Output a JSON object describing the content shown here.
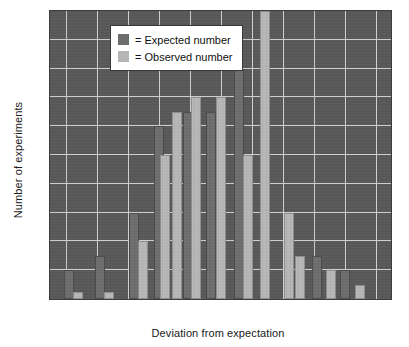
{
  "chart_data": {
    "type": "bar",
    "title": "",
    "xlabel": "Deviation from expectation",
    "ylabel": "Number of experiments",
    "xlim": [
      -2.75,
      2.75
    ],
    "ylim": [
      0,
      20
    ],
    "grid": true,
    "legend_position": "top-left",
    "xticks": [
      "0",
      "−2.5",
      "−2.0",
      "−1.5",
      "−1.0",
      "−0.5",
      "0",
      "0.5",
      "1.0",
      "1.5",
      "2.0",
      "2.5"
    ],
    "xtick_values": [
      -3.0,
      -2.5,
      -2.0,
      -1.5,
      -1.0,
      -0.5,
      0,
      0.5,
      1.0,
      1.5,
      2.0,
      2.5
    ],
    "yticks": [
      "0",
      "2",
      "4",
      "6",
      "8",
      "10",
      "12",
      "14",
      "16",
      "18",
      "20"
    ],
    "ytick_values": [
      0,
      2,
      4,
      6,
      8,
      10,
      12,
      14,
      16,
      18,
      20
    ],
    "categories": [
      -2.5,
      -2.25,
      -2.0,
      -1.75,
      -1.5,
      -1.25,
      -1.0,
      -0.75,
      -0.5,
      -0.25,
      0,
      0.25,
      0.5,
      0.75,
      1.0,
      1.25,
      1.5,
      1.75,
      2.0,
      2.25
    ],
    "series": [
      {
        "name": "Expected number",
        "color": "#6d6d6d",
        "values": [
          2,
          0,
          3,
          0,
          0,
          6,
          0,
          12,
          13,
          0,
          13,
          0,
          16,
          0,
          0,
          0,
          0,
          3,
          2,
          0
        ]
      },
      {
        "name": "Observed number",
        "color": "#b6b6b6",
        "values": [
          0,
          0.5,
          0,
          0.5,
          3,
          4,
          10,
          0,
          13,
          14,
          0,
          14,
          10,
          20,
          0,
          6,
          2,
          0,
          0,
          1
        ]
      }
    ],
    "bars": [
      {
        "x": -2.45,
        "value": 2,
        "series": "Expected number"
      },
      {
        "x": -2.3,
        "value": 0.5,
        "series": "Observed number"
      },
      {
        "x": -1.95,
        "value": 3,
        "series": "Expected number"
      },
      {
        "x": -1.8,
        "value": 0.5,
        "series": "Observed number"
      },
      {
        "x": -1.4,
        "value": 6,
        "series": "Expected number"
      },
      {
        "x": -1.25,
        "value": 4,
        "series": "Observed number"
      },
      {
        "x": -1.0,
        "value": 12,
        "series": "Expected number"
      },
      {
        "x": -0.9,
        "value": 10,
        "series": "Observed number"
      },
      {
        "x": -0.7,
        "value": 13,
        "series": "Observed number"
      },
      {
        "x": -0.52,
        "value": 13,
        "series": "Expected number"
      },
      {
        "x": -0.4,
        "value": 14,
        "series": "Observed number"
      },
      {
        "x": -0.15,
        "value": 13,
        "series": "Expected number"
      },
      {
        "x": 0.0,
        "value": 14,
        "series": "Observed number"
      },
      {
        "x": 0.3,
        "value": 16,
        "series": "Expected number"
      },
      {
        "x": 0.45,
        "value": 10,
        "series": "Observed number"
      },
      {
        "x": 0.72,
        "value": 20,
        "series": "Observed number"
      },
      {
        "x": 1.1,
        "value": 6,
        "series": "Observed number"
      },
      {
        "x": 1.28,
        "value": 3,
        "series": "Observed number"
      },
      {
        "x": 1.55,
        "value": 3,
        "series": "Expected number"
      },
      {
        "x": 1.78,
        "value": 2,
        "series": "Observed number"
      },
      {
        "x": 2.0,
        "value": 2,
        "series": "Expected number"
      },
      {
        "x": 2.25,
        "value": 1,
        "series": "Observed number"
      }
    ]
  },
  "legend": {
    "items": [
      {
        "label": "= Expected number",
        "swatch": "dark-swatch-icon"
      },
      {
        "label": "= Observed number",
        "swatch": "light-swatch-icon"
      }
    ]
  },
  "colors": {
    "plot_background": "#585858",
    "gridline": "#cfcfcf",
    "expected_bar": "#6d6d6d",
    "observed_bar": "#b6b6b6",
    "text": "#1a1a1a"
  }
}
